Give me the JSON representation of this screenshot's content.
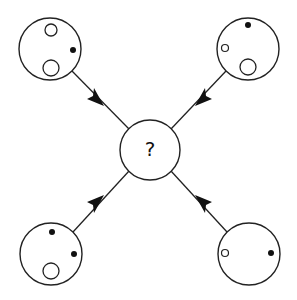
{
  "diagram": {
    "title": "",
    "center": {
      "label": "?",
      "cx": 150,
      "cy": 150,
      "r": 30
    },
    "stroke_color": "#222222",
    "fill_dot_color": "#111111",
    "outer_circles": [
      {
        "position": "top-left",
        "cx": 50,
        "cy": 49,
        "r": 31,
        "elements": [
          {
            "type": "open",
            "cx": 51,
            "cy": 30,
            "r": 6
          },
          {
            "type": "filled",
            "cx": 73,
            "cy": 50,
            "r": 3
          },
          {
            "type": "open",
            "cx": 51,
            "cy": 68,
            "r": 8
          }
        ]
      },
      {
        "position": "top-right",
        "cx": 248,
        "cy": 49,
        "r": 31,
        "elements": [
          {
            "type": "filled",
            "cx": 248,
            "cy": 25,
            "r": 3
          },
          {
            "type": "open",
            "cx": 225,
            "cy": 48,
            "r": 3.5
          },
          {
            "type": "open",
            "cx": 248,
            "cy": 67,
            "r": 8
          }
        ]
      },
      {
        "position": "bottom-left",
        "cx": 51,
        "cy": 254,
        "r": 31,
        "elements": [
          {
            "type": "filled",
            "cx": 52,
            "cy": 232,
            "r": 3
          },
          {
            "type": "filled",
            "cx": 74,
            "cy": 254,
            "r": 3
          },
          {
            "type": "open",
            "cx": 51,
            "cy": 271,
            "r": 8
          }
        ]
      },
      {
        "position": "bottom-right",
        "cx": 249,
        "cy": 254,
        "r": 31,
        "elements": [
          {
            "type": "open",
            "cx": 225,
            "cy": 253,
            "r": 3.5
          },
          {
            "type": "filled",
            "cx": 271,
            "cy": 253,
            "r": 3
          }
        ]
      }
    ],
    "arrows": [
      {
        "from": "top-left",
        "to": "center",
        "direction": "toward-center"
      },
      {
        "from": "top-right",
        "to": "center",
        "direction": "toward-center"
      },
      {
        "from": "bottom-left",
        "to": "center",
        "direction": "toward-center"
      },
      {
        "from": "bottom-right",
        "to": "center",
        "direction": "toward-center"
      }
    ]
  }
}
